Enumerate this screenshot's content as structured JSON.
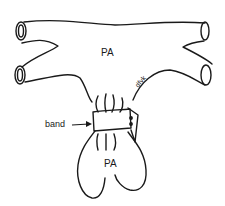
{
  "figure": {
    "labels": {
      "pa_top": "PA",
      "pa_bottom": "PA",
      "band": "band",
      "signature": "dfvk"
    },
    "colors": {
      "line": "#1a1a1a",
      "background": "#ffffff"
    }
  }
}
